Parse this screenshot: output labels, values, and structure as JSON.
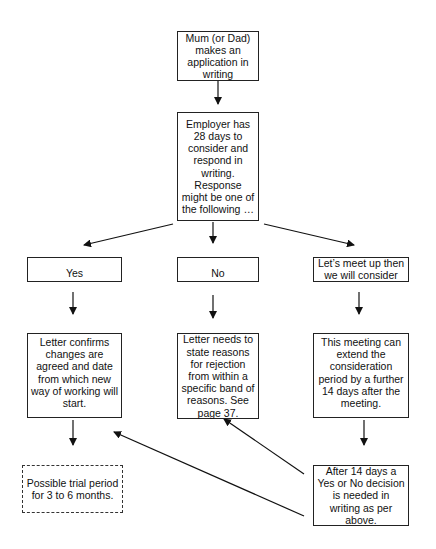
{
  "diagram": {
    "nodes": {
      "application": {
        "text": "Mum (or Dad) makes an application in writing"
      },
      "employer": {
        "text": "Employer has 28 days to consider and respond in writing. Response might be one of the following …"
      },
      "yes": {
        "text": "Yes"
      },
      "no": {
        "text": "No"
      },
      "consider": {
        "text": "Let’s meet up then we will consider"
      },
      "yes_letter": {
        "text": "Letter confirms changes are agreed and date from which new way of working will start."
      },
      "no_letter": {
        "text": "Letter needs to state reasons for rejection from within a specific band of reasons. See page 37."
      },
      "meeting": {
        "text": "This meeting can extend the consideration period by a further 14 days after the meeting."
      },
      "trial": {
        "text": "Possible trial period for 3 to 6 months."
      },
      "after_14": {
        "text": "After 14 days a Yes or No decision is needed in writing as per above."
      }
    },
    "edges": [
      {
        "from": "application",
        "to": "employer"
      },
      {
        "from": "employer",
        "to": "yes"
      },
      {
        "from": "employer",
        "to": "no"
      },
      {
        "from": "employer",
        "to": "consider"
      },
      {
        "from": "yes",
        "to": "yes_letter"
      },
      {
        "from": "no",
        "to": "no_letter"
      },
      {
        "from": "consider",
        "to": "meeting"
      },
      {
        "from": "yes_letter",
        "to": "trial"
      },
      {
        "from": "meeting",
        "to": "after_14"
      },
      {
        "from": "after_14",
        "to": "no_letter"
      },
      {
        "from": "after_14",
        "to": "yes_letter"
      }
    ],
    "colors": {
      "line": "#111111",
      "background": "#ffffff"
    }
  }
}
